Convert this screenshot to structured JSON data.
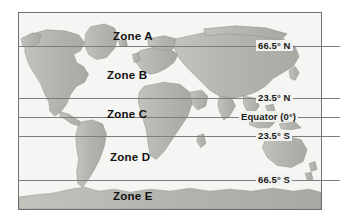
{
  "figure": {
    "frame_color": "#6f6f6f",
    "ocean_color": "#f5f5f3",
    "land_color": "#b9b9b4",
    "line_color": "#7d7d7d",
    "text_color": "#111111"
  },
  "latitude_lines": [
    {
      "id": "arctic-circle",
      "label": "66.5° N",
      "y": 46
    },
    {
      "id": "tropic-of-cancer",
      "label": "23.5° N",
      "y": 98
    },
    {
      "id": "equator",
      "label": "Equator (0°)",
      "y": 117
    },
    {
      "id": "tropic-of-capricorn",
      "label": "23.5° S",
      "y": 136
    },
    {
      "id": "antarctic-circle",
      "label": "66.5° S",
      "y": 180
    }
  ],
  "zones": [
    {
      "id": "zone-a",
      "label": "Zone A",
      "x": 113,
      "y": 30
    },
    {
      "id": "zone-b",
      "label": "Zone B",
      "x": 107,
      "y": 69
    },
    {
      "id": "zone-c",
      "label": "Zone C",
      "x": 107,
      "y": 108
    },
    {
      "id": "zone-d",
      "label": "Zone D",
      "x": 110,
      "y": 151
    },
    {
      "id": "zone-e",
      "label": "Zone E",
      "x": 113,
      "y": 190
    }
  ]
}
